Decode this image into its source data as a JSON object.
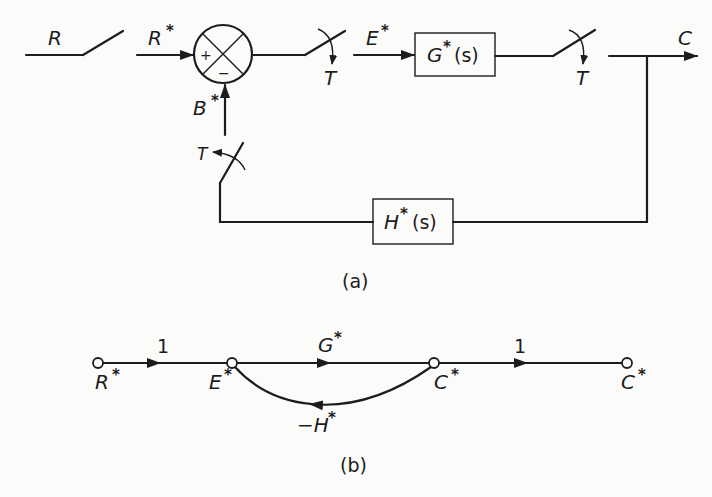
{
  "diagram_a": {
    "caption": "(a)",
    "input_label": "R",
    "sampled_input_label": "R",
    "feedback_label": "B",
    "error_label": "E",
    "output_label": "C",
    "star": "*",
    "sampler_label": "T",
    "sum_plus": "+",
    "sum_minus": "−",
    "forward_block": {
      "name": "G",
      "arg": "(s)"
    },
    "feedback_block": {
      "name": "H",
      "arg": "(s)"
    }
  },
  "diagram_b": {
    "caption": "(b)",
    "star": "*",
    "nodes": [
      {
        "id": "R",
        "label": "R"
      },
      {
        "id": "E",
        "label": "E"
      },
      {
        "id": "C1",
        "label": "C"
      },
      {
        "id": "C2",
        "label": "C"
      }
    ],
    "branches": [
      {
        "from": "R",
        "to": "E",
        "gain": "1"
      },
      {
        "from": "E",
        "to": "C1",
        "gain": "G"
      },
      {
        "from": "C1",
        "to": "C2",
        "gain": "1"
      },
      {
        "from": "C1",
        "to": "E",
        "gain": "−H"
      }
    ]
  }
}
